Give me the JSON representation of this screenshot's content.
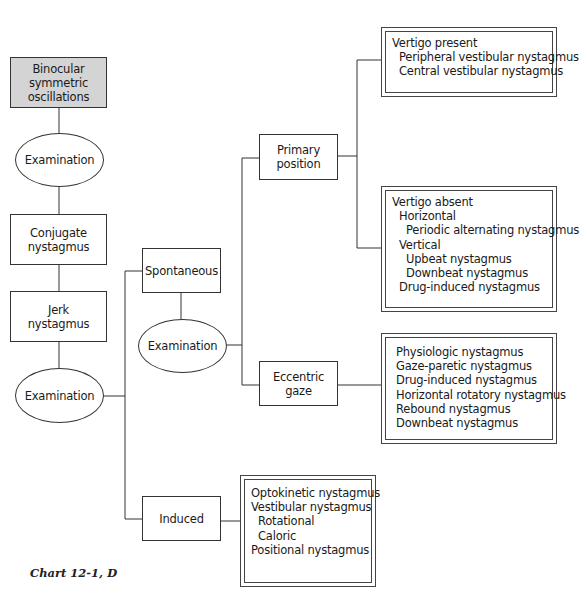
{
  "diagram": {
    "root": "Binocular symmetric oscillations",
    "nodes": {
      "binocular": "Binocular symmetric oscillations",
      "exam1": "Examination",
      "conjugate": "Conjugate nystagmus",
      "jerk": "Jerk nystagmus",
      "exam3": "Examination",
      "spontaneous": "Spontaneous",
      "exam2": "Examination",
      "primary": "Primary position",
      "eccentric": "Eccentric gaze",
      "induced": "Induced"
    },
    "lists": {
      "vertigo_present": [
        {
          "text": "Vertigo present",
          "level": 1
        },
        {
          "text": "Peripheral vestibular nystagmus",
          "level": 2
        },
        {
          "text": "Central vestibular nystagmus",
          "level": 2
        }
      ],
      "vertigo_absent": [
        {
          "text": "Vertigo absent",
          "level": 1
        },
        {
          "text": "Horizontal",
          "level": 2
        },
        {
          "text": "Periodic alternating nystagmus",
          "level": 3
        },
        {
          "text": "Vertical",
          "level": 2
        },
        {
          "text": "Upbeat nystagmus",
          "level": 3
        },
        {
          "text": "Downbeat nystagmus",
          "level": 3
        },
        {
          "text": "Drug-induced nystagmus",
          "level": 2
        }
      ],
      "eccentric_gaze": [
        {
          "text": "Physiologic nystagmus",
          "level": 2
        },
        {
          "text": "Gaze-paretic nystagmus",
          "level": 2
        },
        {
          "text": "Drug-induced nystagmus",
          "level": 2
        },
        {
          "text": "Horizontal rotatory nystagmus",
          "level": 2
        },
        {
          "text": "Rebound nystagmus",
          "level": 2
        },
        {
          "text": "Downbeat nystagmus",
          "level": 2
        }
      ],
      "induced": [
        {
          "text": "Optokinetic nystagmus",
          "level": 1
        },
        {
          "text": "Vestibular nystagmus",
          "level": 1
        },
        {
          "text": "Rotational",
          "level": 2
        },
        {
          "text": "Caloric",
          "level": 2
        },
        {
          "text": "Positional nystagmus",
          "level": 1
        }
      ]
    },
    "caption": "Chart 12-1, D"
  }
}
